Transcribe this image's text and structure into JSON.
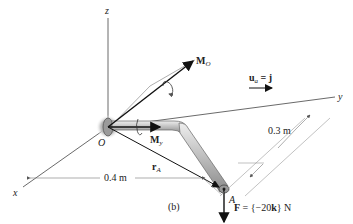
{
  "figure": {
    "caption": "(b)",
    "axes": {
      "x": "x",
      "y": "y",
      "z": "z"
    },
    "points": {
      "origin": "O",
      "end": "A"
    },
    "vectors": {
      "moment_O": {
        "symbol": "M",
        "sub": "O"
      },
      "moment_y": {
        "symbol": "M",
        "sub": "y"
      },
      "position": {
        "symbol": "r",
        "sub": "A"
      },
      "unit": {
        "symbol": "u",
        "sub": "a",
        "rhs": " = j"
      },
      "force": {
        "lhs": "F",
        "rhs": " = {−20",
        "k": "k",
        "tail": "} N"
      }
    },
    "dimensions": {
      "dx": "0.4 m",
      "dy": "0.3 m"
    },
    "colors": {
      "line": "#222222",
      "pipe": "#c8c8c8",
      "pipe_edge": "#666666",
      "dim": "#888888"
    }
  }
}
